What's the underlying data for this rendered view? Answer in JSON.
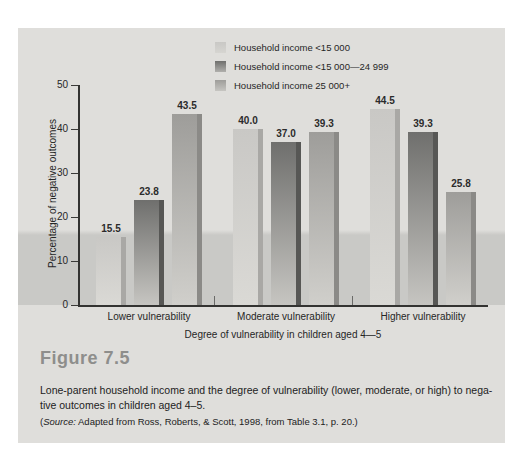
{
  "figure": {
    "number": "Figure 7.5",
    "caption_lines": [
      "Lone-parent household income and the degree of vulnerability (lower, moderate, or high) to nega-",
      "tive outcomes in children aged 4–5."
    ],
    "source_prefix": "(",
    "source_label": "Source:",
    "source_text": " Adapted from Ross, Roberts, & Scott, 1998, from Table 3.1, p. 20.)"
  },
  "chart_data": {
    "type": "bar",
    "title": "",
    "categories": [
      "Lower vulnerability",
      "Moderate vulnerability",
      "Higher vulnerability"
    ],
    "series": [
      {
        "name": "Household income <15 000",
        "values": [
          15.5,
          40.0,
          44.5
        ],
        "color": "#c9c8c5"
      },
      {
        "name": "Household income <15 000—24 999",
        "values": [
          23.8,
          37.0,
          39.3
        ],
        "color": "#6f6f6d"
      },
      {
        "name": "Household income 25 000+",
        "values": [
          43.5,
          39.3,
          25.8
        ],
        "color": "#9e9d9a"
      }
    ],
    "xlabel": "Degree of vulnerability in children aged 4—5",
    "ylabel": "Percentage of negative outcomes",
    "ylim": [
      0,
      50
    ],
    "yticks": [
      0,
      10,
      20,
      30,
      40,
      50
    ],
    "grid": false,
    "legend_position": "top-center",
    "value_labels": true
  },
  "colors": {
    "panel_bg": "#dfdedb",
    "band": "#c9c9c6",
    "axis": "#333331",
    "figure_label": "#8e8e8c",
    "text": "#262626"
  }
}
